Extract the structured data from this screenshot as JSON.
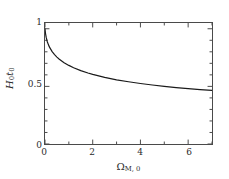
{
  "figure": {
    "background_color": "#ffffff",
    "frame_color": "#4a4a4a",
    "curve_color": "#1a1a1a"
  },
  "axes": {
    "y_ticks": [
      {
        "value": 1,
        "label": "1"
      },
      {
        "value": 0.5,
        "label": "0.5"
      },
      {
        "value": 0,
        "label": "0"
      }
    ],
    "x_ticks": [
      {
        "value": 0,
        "label": "0"
      },
      {
        "value": 2,
        "label": "2"
      },
      {
        "value": 4,
        "label": "4"
      },
      {
        "value": 6,
        "label": "6"
      }
    ],
    "y_label_main": "H",
    "y_label_sub1": "0",
    "y_label_t": "t",
    "y_label_sub2": "0",
    "x_label_main": "Ω",
    "x_label_sub": "M, 0"
  },
  "chart_data": {
    "type": "line",
    "title": "",
    "xlabel": "Ω_{M,0}",
    "ylabel": "H_0 t_0",
    "xlim": [
      0,
      7
    ],
    "ylim": [
      0,
      1.05
    ],
    "grid": false,
    "legend": null,
    "x_ticks": [
      0,
      2,
      4,
      6
    ],
    "x_minor_ticks": [
      1,
      3,
      5,
      7
    ],
    "y_ticks": [
      0,
      0.5,
      1
    ],
    "y_minor_ticks": [
      0.1,
      0.2,
      0.3,
      0.4,
      0.6,
      0.7,
      0.8,
      0.9
    ],
    "series": [
      {
        "name": "H0t0",
        "x": [
          0.0,
          0.02,
          0.05,
          0.1,
          0.15,
          0.2,
          0.3,
          0.4,
          0.5,
          0.6,
          0.8,
          1.0,
          1.2,
          1.5,
          1.8,
          2.0,
          2.5,
          3.0,
          3.5,
          4.0,
          4.5,
          5.0,
          5.5,
          6.0,
          6.5,
          7.0
        ],
        "y": [
          1.0,
          0.96,
          0.925,
          0.885,
          0.858,
          0.836,
          0.802,
          0.776,
          0.754,
          0.736,
          0.706,
          0.682,
          0.662,
          0.637,
          0.616,
          0.604,
          0.578,
          0.557,
          0.54,
          0.525,
          0.512,
          0.5,
          0.49,
          0.481,
          0.472,
          0.465
        ]
      }
    ]
  }
}
